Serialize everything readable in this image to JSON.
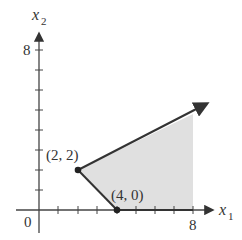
{
  "figure": {
    "type": "feasible-region",
    "axes": {
      "x_label": "x",
      "x_sub": "1",
      "y_label": "x",
      "y_sub": "2",
      "origin_label": "0",
      "x_tick_label": "8",
      "y_tick_label": "8",
      "x_ticks": [
        1,
        2,
        3,
        4,
        5,
        6,
        7,
        8
      ],
      "y_ticks": [
        1,
        2,
        3,
        4,
        5,
        6,
        7,
        8
      ]
    },
    "vertices": [
      {
        "label": "(2, 2)",
        "x": 2,
        "y": 2
      },
      {
        "label": "(4, 0)",
        "x": 4,
        "y": 0
      }
    ],
    "boundary": {
      "ray_direction_from_2_2": "up-right toward (8.9, 5.5)",
      "segment": "(2,2) to (4,0)",
      "x_axis_ray": "(4,0) toward +x"
    },
    "colors": {
      "region_fill": "#e0e0e0",
      "lines": "#333333",
      "axis": "#444444"
    }
  }
}
